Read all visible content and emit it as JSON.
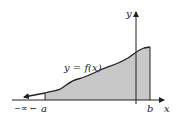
{
  "diagram": {
    "curve_label": "y = f(x)",
    "x_axis_label": "x",
    "y_axis_label": "y",
    "lower_limit_label": "a",
    "upper_limit_label": "b",
    "infinity_label": "−∞ ←",
    "colors": {
      "shade": "#c8c8c8",
      "stroke": "#222222"
    }
  }
}
